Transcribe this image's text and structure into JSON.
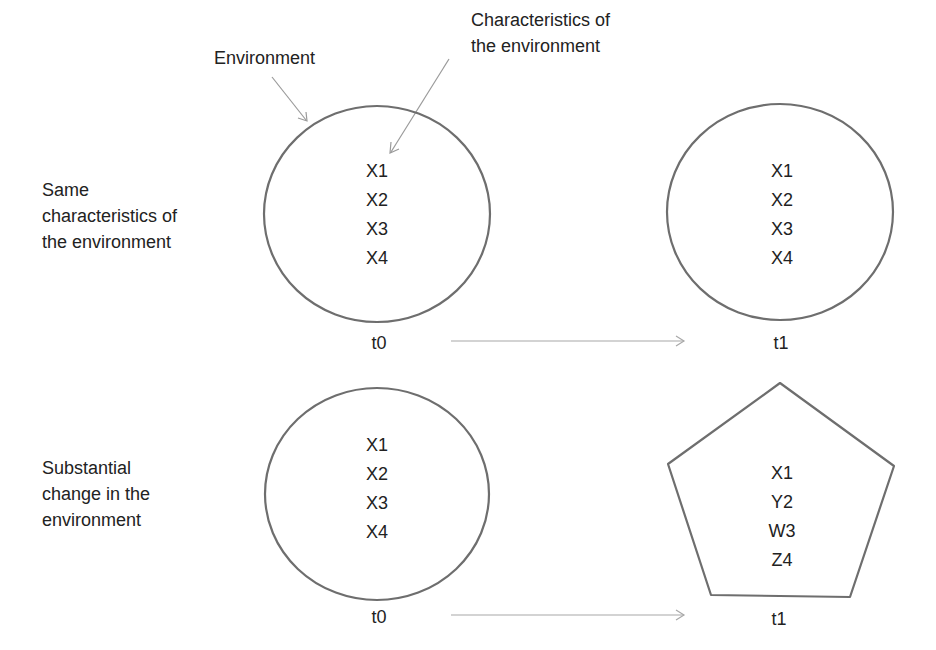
{
  "annotations": {
    "environment": "Environment",
    "characteristics_line1": "Characteristics of",
    "characteristics_line2": "the environment"
  },
  "rows": [
    {
      "side_label": [
        "Same",
        "characteristics of",
        "the environment"
      ],
      "left_shape": "circle",
      "left_vars": [
        "X1",
        "X2",
        "X3",
        "X4"
      ],
      "left_time": "t0",
      "right_shape": "circle",
      "right_vars": [
        "X1",
        "X2",
        "X3",
        "X4"
      ],
      "right_time": "t1"
    },
    {
      "side_label": [
        "Substantial",
        "change in the",
        "environment"
      ],
      "left_shape": "circle",
      "left_vars": [
        "X1",
        "X2",
        "X3",
        "X4"
      ],
      "left_time": "t0",
      "right_shape": "pentagon",
      "right_vars": [
        "X1",
        "Y2",
        "W3",
        "Z4"
      ],
      "right_time": "t1"
    }
  ],
  "colors": {
    "shape_stroke": "#6e6e6e",
    "arrow_stroke": "#a8a8a8",
    "text": "#222222"
  }
}
